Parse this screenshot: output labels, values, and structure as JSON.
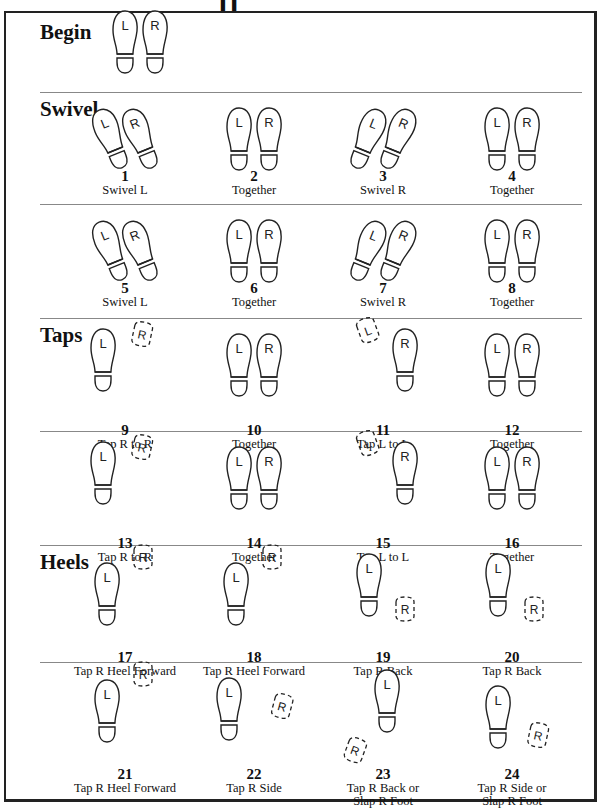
{
  "title_fragment": "11",
  "sections": [
    {
      "label": "Begin",
      "top": 20
    },
    {
      "label": "Swivel",
      "top": 97
    },
    {
      "label": "Taps",
      "top": 323
    },
    {
      "label": "Heels",
      "top": 550
    }
  ],
  "dividers": [
    92,
    204,
    318,
    431,
    545,
    662
  ],
  "begin": {
    "feet": "together",
    "x": 110,
    "y": 32
  },
  "steps": [
    {
      "n": "1",
      "caption": "Swivel L",
      "col": 0,
      "row": 0,
      "pose": "swivel-l"
    },
    {
      "n": "2",
      "caption": "Together",
      "col": 1,
      "row": 0,
      "pose": "together"
    },
    {
      "n": "3",
      "caption": "Swivel R",
      "col": 2,
      "row": 0,
      "pose": "swivel-r"
    },
    {
      "n": "4",
      "caption": "Together",
      "col": 3,
      "row": 0,
      "pose": "together"
    },
    {
      "n": "5",
      "caption": "Swivel L",
      "col": 0,
      "row": 1,
      "pose": "swivel-l"
    },
    {
      "n": "6",
      "caption": "Together",
      "col": 1,
      "row": 1,
      "pose": "together"
    },
    {
      "n": "7",
      "caption": "Swivel R",
      "col": 2,
      "row": 1,
      "pose": "swivel-r"
    },
    {
      "n": "8",
      "caption": "Together",
      "col": 3,
      "row": 1,
      "pose": "together"
    },
    {
      "n": "9",
      "caption": "Tap R to R",
      "col": 0,
      "row": 2,
      "pose": "tap-r-right"
    },
    {
      "n": "10",
      "caption": "Together",
      "col": 1,
      "row": 2,
      "pose": "together"
    },
    {
      "n": "11",
      "caption": "Tap L to L",
      "col": 2,
      "row": 2,
      "pose": "tap-l-left"
    },
    {
      "n": "12",
      "caption": "Together",
      "col": 3,
      "row": 2,
      "pose": "together"
    },
    {
      "n": "13",
      "caption": "Tap R to R",
      "col": 0,
      "row": 3,
      "pose": "tap-r-right"
    },
    {
      "n": "14",
      "caption": "Together",
      "col": 1,
      "row": 3,
      "pose": "together"
    },
    {
      "n": "15",
      "caption": "Tap L to L",
      "col": 2,
      "row": 3,
      "pose": "tap-l-left"
    },
    {
      "n": "16",
      "caption": "Together",
      "col": 3,
      "row": 3,
      "pose": "together"
    },
    {
      "n": "17",
      "caption": "Tap R Heel Forward",
      "col": 0,
      "row": 4,
      "pose": "heel-fwd"
    },
    {
      "n": "18",
      "caption": "Tap R Heel Forward",
      "col": 1,
      "row": 4,
      "pose": "heel-fwd"
    },
    {
      "n": "19",
      "caption": "Tap R Back",
      "col": 2,
      "row": 4,
      "pose": "tap-back"
    },
    {
      "n": "20",
      "caption": "Tap R Back",
      "col": 3,
      "row": 4,
      "pose": "tap-back"
    },
    {
      "n": "21",
      "caption": "Tap R Heel Forward",
      "col": 0,
      "row": 5,
      "pose": "heel-fwd"
    },
    {
      "n": "22",
      "caption": "Tap R Side",
      "col": 1,
      "row": 5,
      "pose": "tap-side"
    },
    {
      "n": "23",
      "caption": "Tap R Back or Slap R Foot",
      "caption_lines": [
        "Tap R Back or",
        "Slap R Foot"
      ],
      "col": 2,
      "row": 5,
      "pose": "tap-back-far"
    },
    {
      "n": "24",
      "caption": "Tap R Side or Slap R Foot",
      "caption_lines": [
        "Tap R Side or",
        "Slap R Foot"
      ],
      "col": 3,
      "row": 5,
      "pose": "tap-side-low"
    }
  ],
  "foot_letters": {
    "left": "L",
    "right": "R"
  }
}
